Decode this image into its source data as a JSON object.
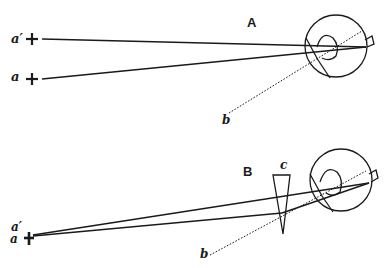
{
  "figure": {
    "panel_a": {
      "title": "A",
      "point_upper_label": "a′",
      "point_lower_label": "a",
      "axis_label": "b"
    },
    "panel_b": {
      "title": "B",
      "prism_label": "c",
      "point_upper_label": "a′",
      "point_lower_label": "a",
      "axis_label": "b"
    },
    "colors": {
      "ink": "#1a1a1a",
      "background": "#ffffff"
    }
  }
}
